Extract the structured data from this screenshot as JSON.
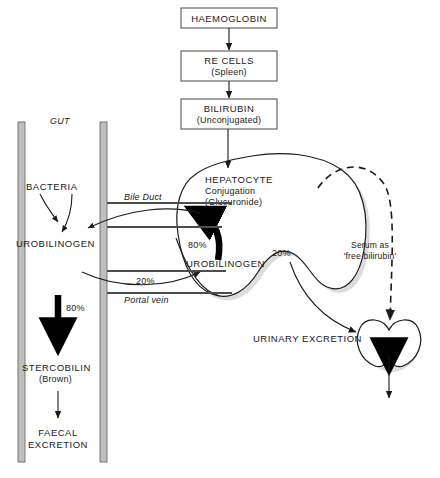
{
  "diagram": {
    "boxes": [
      {
        "id": "haemoglobin",
        "label": "HAEMOGLOBIN",
        "sub": ""
      },
      {
        "id": "re-cells",
        "label": "RE CELLS",
        "sub": "(Spleen)"
      },
      {
        "id": "bilirubin",
        "label": "BILIRUBIN",
        "sub": "(Unconjugated)"
      }
    ],
    "gut": {
      "label": "GUT",
      "bacteria_label": "BACTERIA",
      "urobilinogen_label": "UROBILINOGEN",
      "percent_to_stercobilin": "80%",
      "stercobilin_label": "STERCOBILIN",
      "stercobilin_sub": "(Brown)",
      "faecal_line1": "FAECAL",
      "faecal_line2": "EXCRETION"
    },
    "vessels": {
      "bile_duct": "Bile Duct",
      "portal_vein": "Portal vein",
      "portal_percent": "20%"
    },
    "hepatocyte": {
      "label": "HEPATOCYTE",
      "line2": "Conjugation",
      "line3": "(Glucuronide)",
      "urobilinogen_label": "UROBILINOGEN",
      "percent_recycled": "80%",
      "percent_systemic": "20%"
    },
    "kidney": {
      "urinary_label": "URINARY EXCRETION",
      "serum_line1": "Serum as",
      "serum_line2": "'free bilirubin'"
    },
    "colors": {
      "ink": "#1a1a1a",
      "box_stroke": "#58585a",
      "duct": "#4d4d4f",
      "blob_shadow": "#dcdcdc",
      "gut_wall": "#bfbfbf",
      "background": "#ffffff"
    }
  }
}
